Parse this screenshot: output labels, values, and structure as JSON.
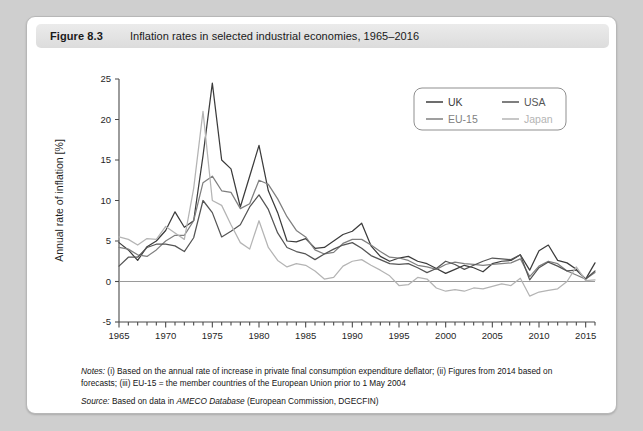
{
  "figure": {
    "number": "Figure 8.3",
    "title": "Inflation rates in selected industrial economies, 1965–2016"
  },
  "notes": {
    "label": "Notes:",
    "line1": " (i) Based on the annual rate of increase in private final consumption expenditure deflator; (ii) Figures from 2014 based on",
    "line2": "forecasts; (iii) EU-15 = the member countries of the European Union prior to 1 May 2004",
    "source_label": "Source:",
    "source_pre": " Based on data in ",
    "source_italic": "AMECO Database",
    "source_post": " (European Commission, DGECFIN)"
  },
  "colors": {
    "uk": "#3c3c3c",
    "usa": "#555555",
    "eu15": "#7f7f7f",
    "japan": "#b4b4b4",
    "axis": "#4a4a4a",
    "zero_line": "#9a9a9a",
    "card_bg": "#ffffff",
    "page_bg": "#cfcfcf",
    "title_bar": "#e4e4e4"
  },
  "chart_data": {
    "type": "line",
    "title": "Inflation rates in selected industrial economies, 1965–2016",
    "xlabel": "",
    "ylabel": "Annual rate of inflation [%]",
    "xlim": [
      1965,
      2016
    ],
    "ylim": [
      -5,
      25
    ],
    "yticks": [
      -5,
      0,
      5,
      10,
      15,
      20,
      25
    ],
    "xticks": [
      1965,
      1970,
      1975,
      1980,
      1985,
      1990,
      1995,
      2000,
      2005,
      2010,
      2015
    ],
    "xtick_minor_step": 1,
    "grid": false,
    "zero_line": true,
    "legend": {
      "position": "top-right",
      "entries": [
        "UK",
        "EU-15",
        "USA",
        "Japan"
      ]
    },
    "x": [
      1965,
      1966,
      1967,
      1968,
      1969,
      1970,
      1971,
      1972,
      1973,
      1974,
      1975,
      1976,
      1977,
      1978,
      1979,
      1980,
      1981,
      1982,
      1983,
      1984,
      1985,
      1986,
      1987,
      1988,
      1989,
      1990,
      1991,
      1992,
      1993,
      1994,
      1995,
      1996,
      1997,
      1998,
      1999,
      2000,
      2001,
      2002,
      2003,
      2004,
      2005,
      2006,
      2007,
      2008,
      2009,
      2010,
      2011,
      2012,
      2013,
      2014,
      2015,
      2016
    ],
    "series": [
      {
        "name": "UK",
        "color": "#3c3c3c",
        "values": [
          4.8,
          3.9,
          2.6,
          4.3,
          5.0,
          6.3,
          8.6,
          6.7,
          7.5,
          15.5,
          24.5,
          15.0,
          13.9,
          9.2,
          13.0,
          16.8,
          11.2,
          8.5,
          5.0,
          4.9,
          5.3,
          4.1,
          4.2,
          5.0,
          5.8,
          6.2,
          7.2,
          4.4,
          3.1,
          2.5,
          2.9,
          3.1,
          2.5,
          2.2,
          1.6,
          1.0,
          1.5,
          2.0,
          1.7,
          1.2,
          2.2,
          2.5,
          2.6,
          3.3,
          1.4,
          3.8,
          4.5,
          2.6,
          2.3,
          1.5,
          0.3,
          2.3
        ]
      },
      {
        "name": "EU-15",
        "color": "#7f7f7f",
        "values": [
          4.2,
          4.0,
          3.3,
          3.1,
          3.9,
          5.0,
          5.7,
          5.7,
          7.5,
          12.2,
          13.0,
          11.2,
          11.0,
          9.0,
          9.6,
          12.5,
          12.0,
          10.2,
          8.0,
          6.3,
          5.5,
          3.9,
          3.4,
          3.6,
          4.7,
          5.2,
          5.2,
          4.5,
          3.7,
          3.0,
          2.9,
          2.6,
          2.0,
          1.8,
          1.5,
          2.1,
          2.4,
          2.2,
          2.1,
          2.0,
          2.1,
          2.2,
          2.3,
          2.8,
          0.6,
          1.9,
          2.5,
          2.2,
          1.3,
          0.8,
          0.3,
          1.1
        ]
      },
      {
        "name": "USA",
        "color": "#555555",
        "values": [
          1.9,
          3.0,
          3.0,
          4.2,
          4.6,
          4.6,
          4.4,
          3.7,
          5.4,
          10.0,
          8.5,
          5.5,
          6.2,
          7.0,
          9.2,
          10.7,
          8.9,
          6.0,
          4.2,
          3.7,
          3.4,
          2.7,
          3.4,
          4.0,
          4.5,
          4.8,
          4.1,
          3.2,
          2.7,
          2.2,
          2.1,
          2.2,
          1.7,
          1.1,
          1.6,
          2.5,
          2.1,
          1.5,
          2.0,
          2.5,
          2.9,
          2.8,
          2.7,
          3.3,
          0.2,
          1.7,
          2.4,
          1.9,
          1.3,
          1.4,
          0.3,
          1.3
        ]
      },
      {
        "name": "Japan",
        "color": "#b4b4b4",
        "values": [
          5.5,
          5.2,
          4.5,
          5.3,
          5.2,
          6.8,
          6.0,
          5.2,
          11.5,
          21.0,
          10.0,
          9.4,
          7.0,
          4.8,
          4.0,
          7.5,
          4.2,
          2.6,
          1.8,
          2.2,
          2.0,
          1.3,
          0.3,
          0.5,
          1.9,
          2.5,
          2.7,
          2.0,
          1.4,
          0.7,
          -0.5,
          -0.4,
          0.5,
          0.3,
          -0.8,
          -1.2,
          -1.0,
          -1.2,
          -0.8,
          -0.9,
          -0.6,
          -0.3,
          -0.5,
          0.4,
          -1.8,
          -1.3,
          -1.1,
          -0.9,
          0.0,
          1.8,
          0.1,
          0.2
        ]
      }
    ]
  }
}
